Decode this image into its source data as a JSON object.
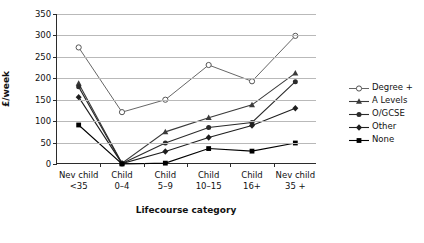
{
  "chart_data": {
    "type": "line",
    "title": "",
    "xlabel": "Lifecourse category",
    "ylabel": "£/week",
    "categories": [
      {
        "line1": "Nev child",
        "line2": "<35"
      },
      {
        "line1": "Child",
        "line2": "0–4"
      },
      {
        "line1": "Child",
        "line2": "5–9"
      },
      {
        "line1": "Child",
        "line2": "10–15"
      },
      {
        "line1": "Child",
        "line2": "16+"
      },
      {
        "line1": "Nev child",
        "line2": "35 +"
      }
    ],
    "category_labels": [
      "Nev child <35",
      "Child 0–4",
      "Child 5–9",
      "Child 10–15",
      "Child 16+",
      "Nev child 35 +"
    ],
    "ylim": [
      0,
      350
    ],
    "yticks": [
      0,
      50,
      100,
      150,
      200,
      250,
      300,
      350
    ],
    "ytick_labels": [
      "0",
      "50",
      "100",
      "150",
      "200",
      "250",
      "300",
      "350"
    ],
    "grid": true,
    "legend_position": "right",
    "series": [
      {
        "name": "Degree +",
        "marker": "open-circle",
        "color": "#555555",
        "values": [
          272,
          121,
          150,
          231,
          193,
          299
        ]
      },
      {
        "name": "A Levels",
        "marker": "triangle",
        "color": "#3a3a3a",
        "values": [
          188,
          2,
          75,
          108,
          138,
          212
        ]
      },
      {
        "name": "O/GCSE",
        "marker": "circle",
        "color": "#2b2b2b",
        "values": [
          180,
          1,
          49,
          85,
          97,
          192
        ]
      },
      {
        "name": "Other",
        "marker": "diamond",
        "color": "#1e1e1e",
        "values": [
          156,
          1,
          29,
          62,
          90,
          130
        ]
      },
      {
        "name": "None",
        "marker": "square",
        "color": "#000000",
        "values": [
          91,
          0,
          2,
          36,
          30,
          49
        ]
      }
    ]
  },
  "legend": {
    "entries": [
      "Degree +",
      "A Levels",
      "O/GCSE",
      "Other",
      "None"
    ]
  }
}
